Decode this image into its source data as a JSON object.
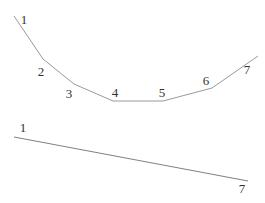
{
  "figure": {
    "width": 265,
    "height": 203,
    "background": "#ffffff",
    "title": ""
  },
  "style": {
    "curve_stroke_color": "#999999",
    "line_stroke_color": "#808080",
    "label_color": "#333333"
  },
  "chart_data": {
    "type": "line",
    "title": "",
    "xlabel": "",
    "ylabel": "",
    "axes_visible": false,
    "grid": false,
    "legend": false,
    "point_index": [
      1,
      2,
      3,
      4,
      5,
      6,
      7
    ],
    "series": [
      {
        "name": "u-shaped-curve",
        "description": "Convex U-shaped polyline: falls steeply from point 1, flattens between points 4 and 5, rises to point 7",
        "color_key": "curve_stroke_color",
        "points_px": [
          [
            14,
            16
          ],
          [
            43,
            59
          ],
          [
            74,
            84
          ],
          [
            113,
            101
          ],
          [
            163,
            101
          ],
          [
            212,
            88
          ],
          [
            258,
            56
          ]
        ],
        "values_y_up": [
          187,
          144,
          119,
          102,
          102,
          115,
          147
        ],
        "labels": [
          {
            "text": "1",
            "x": 24,
            "y": 24
          },
          {
            "text": "2",
            "x": 41,
            "y": 76
          },
          {
            "text": "3",
            "x": 69,
            "y": 98
          },
          {
            "text": "4",
            "x": 115,
            "y": 97
          },
          {
            "text": "5",
            "x": 162,
            "y": 97
          },
          {
            "text": "6",
            "x": 206,
            "y": 85
          },
          {
            "text": "7",
            "x": 247,
            "y": 74
          }
        ]
      },
      {
        "name": "straight-declining-line",
        "description": "Straight line declining gently from point 1 (left) to point 7 (right)",
        "color_key": "line_stroke_color",
        "points_px": [
          [
            14,
            137
          ],
          [
            248,
            181
          ]
        ],
        "values_y_up": [
          66,
          22
        ],
        "labels": [
          {
            "text": "1",
            "x": 23,
            "y": 132
          },
          {
            "text": "7",
            "x": 242,
            "y": 193
          }
        ]
      }
    ]
  }
}
